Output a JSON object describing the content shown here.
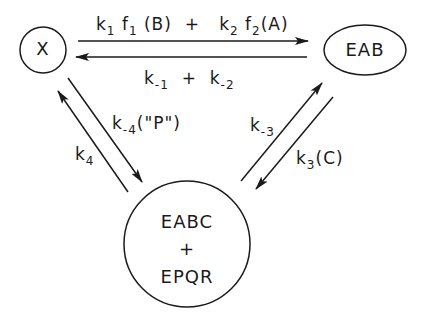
{
  "nodes": {
    "x": {
      "label": "X"
    },
    "eab": {
      "label": "EAB"
    },
    "complex": {
      "line1": "EABC",
      "line2": "+",
      "line3": "EPQR"
    }
  },
  "edges": {
    "forward_top": {
      "k1": "k",
      "k1_sub": "1",
      "f1": "f",
      "f1_sub": "1",
      "arg1": "(B)",
      "plus": "+",
      "k2": "k",
      "k2_sub": "2",
      "f2": "f",
      "f2_sub": "2",
      "arg2": "(A)"
    },
    "reverse_top": {
      "km1": "k",
      "km1_sub": "-1",
      "plus": "+",
      "km2": "k",
      "km2_sub": "-2"
    },
    "left_down": {
      "k": "k",
      "sub": "-4",
      "arg": "(\"P\")"
    },
    "left_up": {
      "k": "k",
      "sub": "4"
    },
    "right_up": {
      "k": "k",
      "sub": "-3"
    },
    "right_down": {
      "k": "k",
      "sub": "3",
      "arg": "(C)"
    }
  },
  "colors": {
    "stroke": "#1a1a1a",
    "background": "#ffffff"
  }
}
